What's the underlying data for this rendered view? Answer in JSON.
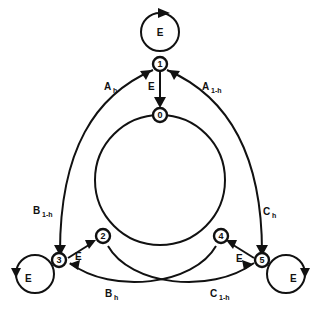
{
  "diagram": {
    "type": "state-transition-graph",
    "nodes": [
      {
        "id": "0",
        "label": "0"
      },
      {
        "id": "1",
        "label": "1"
      },
      {
        "id": "2",
        "label": "2"
      },
      {
        "id": "3",
        "label": "3"
      },
      {
        "id": "4",
        "label": "4"
      },
      {
        "id": "5",
        "label": "5"
      }
    ],
    "edges": [
      {
        "from": "0",
        "to": "1",
        "label": "A",
        "sub": "h"
      },
      {
        "from": "0",
        "to": "1",
        "label": "A",
        "sub": "1-h"
      },
      {
        "from": "1",
        "to": "0",
        "label": "E",
        "sub": ""
      },
      {
        "from": "2",
        "to": "3",
        "label": "B",
        "sub": "1-h"
      },
      {
        "from": "4",
        "to": "3",
        "label": "B",
        "sub": "h"
      },
      {
        "from": "3",
        "to": "2",
        "label": "E",
        "sub": ""
      },
      {
        "from": "0",
        "to": "5",
        "label": "C",
        "sub": "h"
      },
      {
        "from": "2",
        "to": "5",
        "label": "C",
        "sub": "1-h"
      },
      {
        "from": "5",
        "to": "4",
        "label": "E",
        "sub": ""
      },
      {
        "from": "1",
        "to": "1",
        "label": "E",
        "sub": ""
      },
      {
        "from": "3",
        "to": "3",
        "label": "E",
        "sub": ""
      },
      {
        "from": "5",
        "to": "5",
        "label": "E",
        "sub": ""
      }
    ],
    "labels": {
      "a_h": "A",
      "a_h_sub": "h",
      "a_1h": "A",
      "a_1h_sub": "1-h",
      "b_1h": "B",
      "b_1h_sub": "1-h",
      "b_h": "B",
      "b_h_sub": "h",
      "c_h": "C",
      "c_h_sub": "h",
      "c_1h": "C",
      "c_1h_sub": "1-h",
      "e": "E"
    }
  }
}
